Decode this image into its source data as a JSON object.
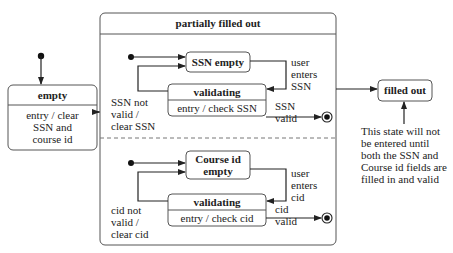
{
  "diagram": {
    "type": "uml-state-machine",
    "states": {
      "empty": {
        "name": "empty",
        "activity": [
          "entry / clear",
          "SSN and",
          "course id"
        ]
      },
      "composite": {
        "name": "partially filled out"
      },
      "ssn_empty": {
        "name": "SSN empty"
      },
      "ssn_validating": {
        "name": "validating",
        "activity": "entry / check SSN"
      },
      "cid_empty": {
        "name": [
          "Course id",
          "empty"
        ]
      },
      "cid_validating": {
        "name": "validating",
        "activity": "entry / check cid"
      },
      "filled_out": {
        "name": "filled out"
      }
    },
    "transitions": {
      "user_enters_ssn": [
        "user",
        "enters",
        "SSN"
      ],
      "ssn_not_valid": [
        "SSN not",
        "valid /",
        "clear SSN"
      ],
      "ssn_valid": [
        "SSN",
        "valid"
      ],
      "user_enters_cid": [
        "user",
        "enters",
        "cid"
      ],
      "cid_not_valid": [
        "cid not",
        "valid /",
        "clear cid"
      ],
      "cid_valid": [
        "cid",
        "valid"
      ]
    },
    "note": [
      "This state will not",
      "be entered until",
      "both the SSN and",
      "Course id fields are",
      "filled in and valid"
    ]
  }
}
